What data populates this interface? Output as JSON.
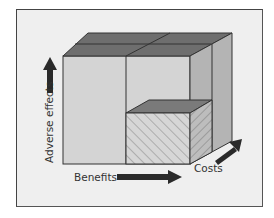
{
  "diagram": {
    "type": "3d-cube",
    "axes": {
      "x": {
        "label": "Benefits",
        "direction": "right"
      },
      "y": {
        "label": "Adverse effects",
        "direction": "up"
      },
      "z": {
        "label": "Costs",
        "direction": "depth"
      }
    },
    "highlight": "hatched sub-cube at high benefits, low adverse effects, low costs",
    "colors": {
      "background": "#efefef",
      "front_face": "#d4d4d4",
      "top_face": "#6e6e6e",
      "side_face": "#b4b4b4",
      "hatch": "#8a8a8a",
      "arrow": "#2a2a2a",
      "line": "#333333"
    }
  }
}
